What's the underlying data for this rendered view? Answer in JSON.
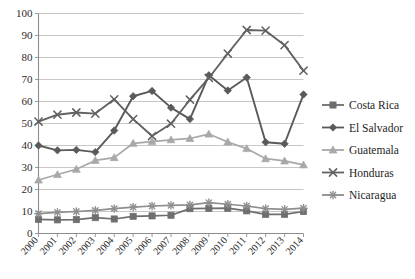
{
  "chart_data": {
    "type": "line",
    "title": "",
    "subtitle": "",
    "xlabel": "",
    "ylabel": "",
    "grid": true,
    "legend_position": "right",
    "ylim": [
      0,
      100
    ],
    "ytick_labels": [
      "0",
      "10",
      "20",
      "30",
      "40",
      "50",
      "60",
      "70",
      "80",
      "90",
      "100"
    ],
    "ytick_values": [
      0,
      10,
      20,
      30,
      40,
      50,
      60,
      70,
      80,
      90,
      100
    ],
    "categories": [
      "2000",
      "2001",
      "2002",
      "2003",
      "2004",
      "2005",
      "2006",
      "2007",
      "2008",
      "2009",
      "2010",
      "2011",
      "2012",
      "2013",
      "2014"
    ],
    "x": [
      2000,
      2001,
      2002,
      2003,
      2004,
      2005,
      2006,
      2007,
      2008,
      2009,
      2010,
      2011,
      2012,
      2013,
      2014
    ],
    "series": [
      {
        "name": "Costa Rica",
        "marker": "square",
        "color": "#6e6e6e",
        "values": [
          6.4,
          6.2,
          6.3,
          7.2,
          6.6,
          7.8,
          8.0,
          8.3,
          11.3,
          11.4,
          11.5,
          10.3,
          8.7,
          8.7,
          10.0
        ]
      },
      {
        "name": "El Salvador",
        "marker": "diamond",
        "color": "#5a5a5a",
        "values": [
          40.0,
          37.8,
          38.0,
          37.0,
          46.8,
          62.4,
          64.8,
          57.2,
          52.0,
          71.9,
          65.0,
          70.9,
          41.5,
          40.8,
          63.2
        ]
      },
      {
        "name": "Guatemala",
        "marker": "triangle",
        "color": "#a8a8a8",
        "values": [
          24.3,
          26.8,
          29.2,
          33.2,
          34.5,
          41.0,
          41.8,
          42.6,
          43.2,
          45.2,
          41.6,
          38.6,
          34.0,
          33.0,
          31.2
        ]
      },
      {
        "name": "Honduras",
        "marker": "x",
        "color": "#616161",
        "values": [
          50.9,
          54.0,
          55.0,
          54.5,
          61.0,
          52.0,
          44.3,
          49.9,
          60.8,
          70.7,
          81.8,
          92.5,
          92.2,
          85.6,
          74.0
        ]
      },
      {
        "name": "Nicaragua",
        "marker": "asterisk",
        "color": "#8e8e8e",
        "values": [
          9.0,
          9.6,
          10.0,
          10.5,
          11.3,
          12.0,
          12.5,
          12.8,
          13.0,
          14.0,
          13.3,
          12.5,
          11.3,
          11.0,
          11.5
        ]
      }
    ]
  },
  "legend": {
    "items": [
      {
        "label": "Costa Rica"
      },
      {
        "label": "El Salvador"
      },
      {
        "label": "Guatemala"
      },
      {
        "label": "Honduras"
      },
      {
        "label": "Nicaragua"
      }
    ]
  },
  "colors": {
    "background": "#ffffff",
    "grid": "#b9b9b9",
    "axis": "#8d8d8d",
    "text": "#1e1e1e"
  }
}
